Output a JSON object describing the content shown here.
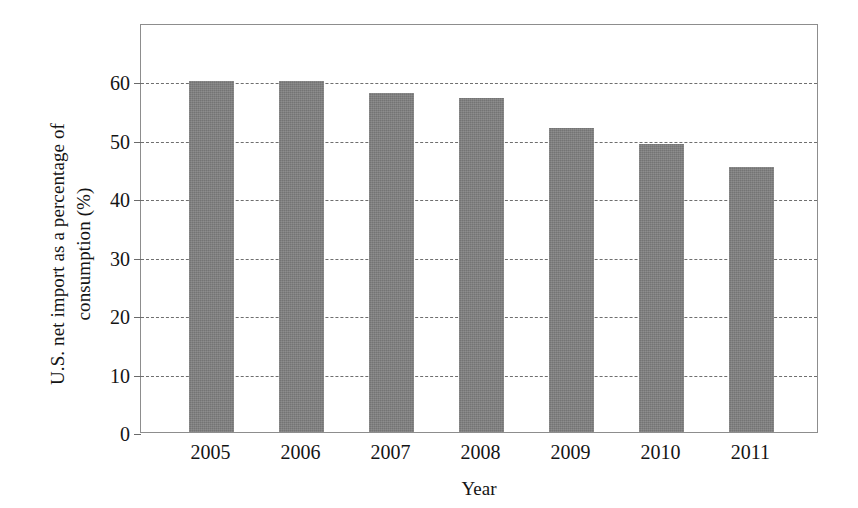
{
  "chart_data": {
    "type": "bar",
    "title": "",
    "subtitle": "",
    "xlabel": "Year",
    "ylabel": "U.S. net import as a percentage of\nconsumption (%)",
    "categories": [
      "2005",
      "2006",
      "2007",
      "2008",
      "2009",
      "2010",
      "2011"
    ],
    "values": [
      60.0,
      60.0,
      58.0,
      57.1,
      52.1,
      49.3,
      45.3
    ],
    "ylim": [
      0,
      70
    ],
    "yticks": [
      0,
      10,
      20,
      30,
      40,
      50,
      60
    ],
    "ytick_labels": [
      "0",
      "10",
      "20",
      "30",
      "40",
      "50",
      "60"
    ],
    "grid": true,
    "grid_axis": "y",
    "grid_style": "dashed",
    "legend": false,
    "legend_position": "none",
    "bar_color": "#808080",
    "grid_color": "#6f6f6f",
    "frame_color": "#8d8d8d",
    "text_color": "#141414",
    "annotations": []
  },
  "axes": {
    "y_title": "U.S. net import as a percentage of\nconsumption (%)",
    "x_title": "Year"
  }
}
